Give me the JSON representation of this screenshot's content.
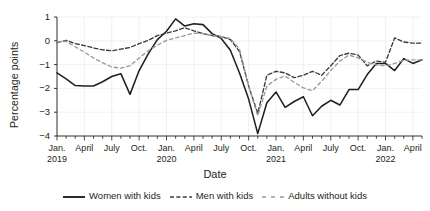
{
  "chart_data": {
    "type": "line",
    "title": "",
    "xlabel": "Date",
    "ylabel": "Percentage points",
    "ylim": [
      -4,
      1
    ],
    "yticks": [
      1,
      0,
      -1,
      -2,
      -3,
      -4
    ],
    "ytick_labels": [
      "1",
      "0",
      "-1",
      "-2",
      "-3",
      "-4"
    ],
    "grid": true,
    "legend_position": "bottom",
    "x": [
      "Jan. 2019",
      "Feb. 2019",
      "March 2019",
      "April 2019",
      "May 2019",
      "June 2019",
      "July 2019",
      "Aug. 2019",
      "Sept. 2019",
      "Oct. 2019",
      "Nov. 2019",
      "Dec. 2019",
      "Jan. 2020",
      "Feb. 2020",
      "March 2020",
      "April 2020",
      "May 2020",
      "June 2020",
      "July 2020",
      "Aug. 2020",
      "Sept. 2020",
      "Oct. 2020",
      "Nov. 2020",
      "Dec. 2020",
      "Jan. 2021",
      "Feb. 2021",
      "March 2021",
      "April 2021",
      "May 2021",
      "June 2021",
      "July 2021",
      "Aug. 2021",
      "Sept. 2021",
      "Oct. 2021",
      "Nov. 2021",
      "Dec. 2021",
      "Jan. 2022",
      "Feb. 2022",
      "March 2022",
      "April 2022",
      "May 2022"
    ],
    "xtick_labels": [
      {
        "label": "Jan.",
        "year": "2019",
        "index": 0
      },
      {
        "label": "April",
        "year": "",
        "index": 3
      },
      {
        "label": "July",
        "year": "",
        "index": 6
      },
      {
        "label": "Oct.",
        "year": "",
        "index": 9
      },
      {
        "label": "Jan.",
        "year": "2020",
        "index": 12
      },
      {
        "label": "April",
        "year": "",
        "index": 15
      },
      {
        "label": "July",
        "year": "",
        "index": 18
      },
      {
        "label": "Oct.",
        "year": "",
        "index": 21
      },
      {
        "label": "Jan.",
        "year": "2021",
        "index": 24
      },
      {
        "label": "April",
        "year": "",
        "index": 27
      },
      {
        "label": "July",
        "year": "",
        "index": 30
      },
      {
        "label": "Oct.",
        "year": "",
        "index": 33
      },
      {
        "label": "Jan.",
        "year": "2022",
        "index": 36
      },
      {
        "label": "April",
        "year": "",
        "index": 39
      }
    ],
    "series": [
      {
        "name": "Women with kids",
        "style": "solid",
        "color": "#231f20",
        "values": [
          -1.35,
          -1.6,
          -1.88,
          -1.9,
          -1.9,
          -1.72,
          -1.5,
          -1.38,
          -2.25,
          -1.25,
          -0.55,
          0.05,
          0.4,
          0.92,
          0.62,
          0.72,
          0.68,
          0.3,
          0.1,
          -0.4,
          -1.35,
          -2.45,
          -3.9,
          -2.6,
          -2.15,
          -2.8,
          -2.55,
          -2.35,
          -3.15,
          -2.75,
          -2.5,
          -2.7,
          -2.05,
          -2.05,
          -1.42,
          -0.95,
          -0.95,
          -1.25,
          -0.75,
          -0.95,
          -0.8
        ]
      },
      {
        "name": "Men with kids",
        "style": "dashed",
        "color": "#3b3b3b",
        "values": [
          -0.08,
          0.02,
          -0.12,
          -0.2,
          -0.3,
          -0.38,
          -0.42,
          -0.35,
          -0.28,
          -0.12,
          0.02,
          0.22,
          0.32,
          0.42,
          0.55,
          0.42,
          0.3,
          0.22,
          0.18,
          0.05,
          -0.45,
          -1.9,
          -3.05,
          -1.45,
          -1.28,
          -1.35,
          -1.55,
          -1.45,
          -1.28,
          -1.45,
          -1.05,
          -0.62,
          -0.52,
          -0.6,
          -1.05,
          -0.85,
          -0.9,
          0.12,
          -0.05,
          -0.1,
          -0.1
        ]
      },
      {
        "name": "Adults without kids",
        "style": "dashed-gray",
        "color": "#9a9a9a",
        "values": [
          -0.05,
          -0.02,
          -0.25,
          -0.48,
          -0.72,
          -0.92,
          -1.1,
          -1.15,
          -1.05,
          -0.72,
          -0.42,
          -0.18,
          0.02,
          0.12,
          0.22,
          0.32,
          0.3,
          0.22,
          0.16,
          0.1,
          -0.35,
          -1.9,
          -3.15,
          -1.9,
          -1.62,
          -1.48,
          -1.75,
          -1.98,
          -2.1,
          -1.7,
          -1.25,
          -0.85,
          -0.6,
          -0.72,
          -0.9,
          -1.02,
          -1.05,
          -0.95,
          -0.82,
          -0.8,
          -0.8
        ]
      }
    ]
  },
  "axes": {
    "y_title": "Percentage points",
    "x_title": "Date"
  },
  "legend": {
    "items": [
      {
        "label": "Women with kids",
        "style": "solid",
        "color": "#231f20"
      },
      {
        "label": "Men with kids",
        "style": "dashed",
        "color": "#3b3b3b"
      },
      {
        "label": "Adults without kids",
        "style": "dashed-gray",
        "color": "#9a9a9a"
      }
    ]
  }
}
